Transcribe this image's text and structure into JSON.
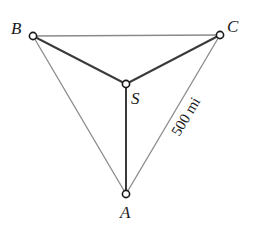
{
  "diagram": {
    "title": "",
    "vertices": {
      "A": {
        "label": "A",
        "x": 126,
        "y": 194
      },
      "B": {
        "label": "B",
        "x": 33,
        "y": 36
      },
      "C": {
        "label": "C",
        "x": 220,
        "y": 35
      },
      "S": {
        "label": "S",
        "x": 126,
        "y": 84
      }
    },
    "outer_edges": [
      {
        "from": "B",
        "to": "C"
      },
      {
        "from": "B",
        "to": "A"
      },
      {
        "from": "C",
        "to": "A"
      }
    ],
    "inner_edges": [
      {
        "from": "B",
        "to": "S"
      },
      {
        "from": "C",
        "to": "S"
      },
      {
        "from": "S",
        "to": "A"
      }
    ],
    "edge_label": {
      "text": "500 mi",
      "edge": "A-C"
    },
    "colors": {
      "outer_edge": "#8a8a8a",
      "inner_edge": "#3a3a3a",
      "vertex_stroke": "#1a1a1a",
      "vertex_fill": "#ffffff",
      "text": "#1a1a1a"
    }
  }
}
